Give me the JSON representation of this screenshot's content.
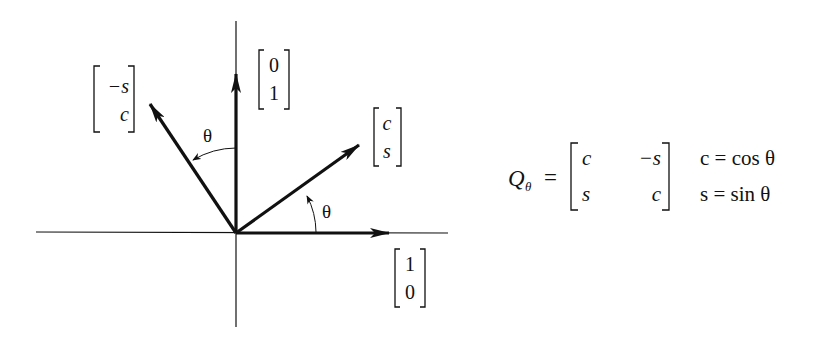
{
  "diagram": {
    "axes": {
      "horizontal": true,
      "vertical": true
    },
    "angle_label": "θ",
    "vectors": [
      {
        "id": "e1",
        "label_top": "1",
        "label_bottom": "0"
      },
      {
        "id": "e2",
        "label_top": "0",
        "label_bottom": "1"
      },
      {
        "id": "q1",
        "label_top": "c",
        "label_bottom": "s"
      },
      {
        "id": "q2",
        "label_top": "−s",
        "label_bottom": "c"
      }
    ],
    "angle_arcs": [
      {
        "between": "e1-q1",
        "label": "θ"
      },
      {
        "between": "e2-q2",
        "label": "θ"
      }
    ]
  },
  "formula": {
    "lhs": "Q",
    "lhs_sub": "θ",
    "equals": "=",
    "matrix": [
      [
        "c",
        "−s"
      ],
      [
        "s",
        "c"
      ]
    ],
    "defs": [
      "c = cos θ",
      "s = sin θ"
    ]
  }
}
